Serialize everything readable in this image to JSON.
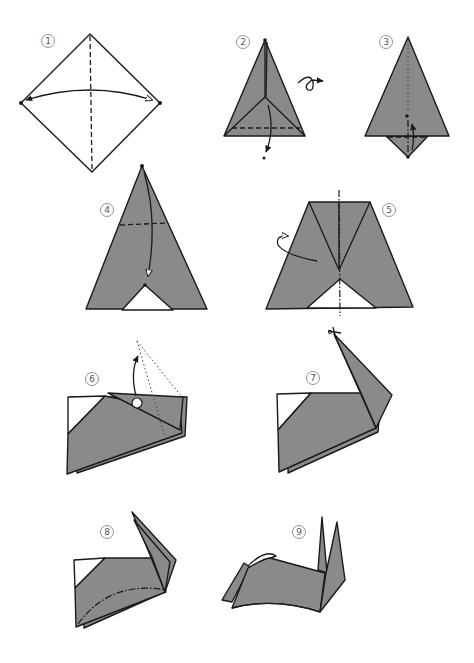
{
  "diagram": {
    "colors": {
      "paper": "#8a8a8a",
      "line": "#1a1a1a",
      "background": "#ffffff",
      "step_number": "#555555"
    },
    "steps": [
      {
        "number": "1",
        "description": "Square diamond, valley fold along vertical diagonal, bring side corners together"
      },
      {
        "number": "2",
        "description": "Gray triangle with inner flaps, valley fold bottom, turn over"
      },
      {
        "number": "3",
        "description": "Tall triangle, fold bottom point up"
      },
      {
        "number": "4",
        "description": "Triangle with white notch at base, fold top point down along dashed line"
      },
      {
        "number": "5",
        "description": "Trapezoid shape, mountain fold in half along center"
      },
      {
        "number": "6",
        "description": "Folded body, pull point up (dotted outline shows result)"
      },
      {
        "number": "7",
        "description": "Body with raised point, cut tip with scissors"
      },
      {
        "number": "8",
        "description": "Body with split ears, mountain fold along curved line"
      },
      {
        "number": "9",
        "description": "Finished rabbit with ears and tail"
      }
    ],
    "symbols": {
      "turn_over": "turn-over-arrow",
      "valley_fold": "dashed-line",
      "mountain_fold": "dash-dot-line",
      "cut": "scissors"
    }
  }
}
